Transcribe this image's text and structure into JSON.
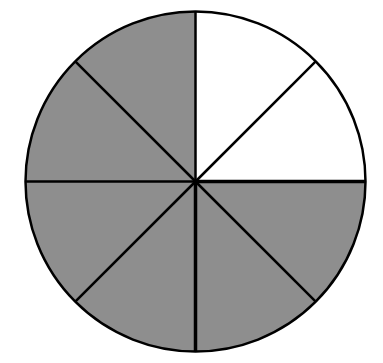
{
  "diagram": {
    "type": "fraction-circle",
    "total_parts": 8,
    "shaded_parts": 6,
    "unshaded_parts": 2,
    "colors": {
      "shaded": "#8e8e8e",
      "unshaded": "#ffffff",
      "stroke": "#000000"
    },
    "slices": [
      {
        "index": 0,
        "start_deg": 0,
        "end_deg": 45,
        "shaded": false
      },
      {
        "index": 1,
        "start_deg": 45,
        "end_deg": 90,
        "shaded": false
      },
      {
        "index": 2,
        "start_deg": 90,
        "end_deg": 135,
        "shaded": true
      },
      {
        "index": 3,
        "start_deg": 135,
        "end_deg": 180,
        "shaded": true
      },
      {
        "index": 4,
        "start_deg": 180,
        "end_deg": 225,
        "shaded": true
      },
      {
        "index": 5,
        "start_deg": 225,
        "end_deg": 270,
        "shaded": true
      },
      {
        "index": 6,
        "start_deg": 270,
        "end_deg": 315,
        "shaded": true
      },
      {
        "index": 7,
        "start_deg": 315,
        "end_deg": 360,
        "shaded": true
      }
    ]
  },
  "chart_data": {
    "type": "pie",
    "title": "",
    "categories": [
      "slice 1",
      "slice 2",
      "slice 3",
      "slice 4",
      "slice 5",
      "slice 6",
      "slice 7",
      "slice 8"
    ],
    "values": [
      1,
      1,
      1,
      1,
      1,
      1,
      1,
      1
    ],
    "shaded": [
      false,
      false,
      true,
      true,
      true,
      true,
      true,
      true
    ],
    "shaded_fraction": "6/8",
    "legend": "none"
  }
}
